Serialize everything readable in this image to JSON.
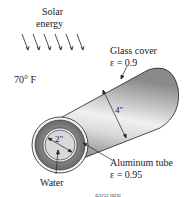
{
  "labels": {
    "solar_line1": "Solar",
    "solar_line2": "energy",
    "ambient_temp": "70° F",
    "glass_line1": "Glass cover",
    "glass_line2": "ε = 0.9",
    "outer_diameter": "4\"",
    "inner_diameter": "2\"",
    "alu_line1": "Aluminum tube",
    "alu_line2": "ε = 0.95",
    "water": "Water",
    "caption": "FIGURE"
  },
  "colors": {
    "stroke": "#222222",
    "cylinder_dark": "#6e6e6e",
    "cylinder_light": "#e8e8e8",
    "water": "#d9d9d9"
  }
}
